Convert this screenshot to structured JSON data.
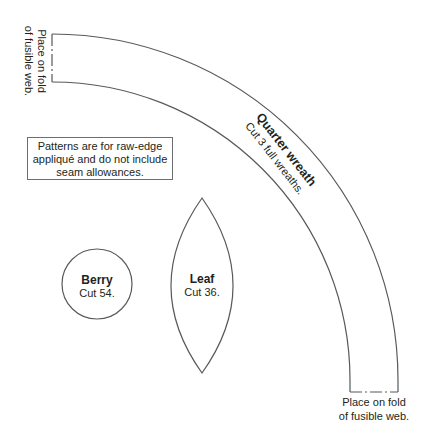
{
  "wreath": {
    "title": "Quarter wreath",
    "instruction": "Cut 3 full wreaths.",
    "fold_top": {
      "line1": "Place on fold",
      "line2": "of fusible web."
    },
    "fold_bottom": {
      "line1": "Place on fold",
      "line2": "of fusible web."
    }
  },
  "note": {
    "line1": "Patterns are for raw-edge",
    "line2": "appliqué and do not include",
    "line3": "seam allowances."
  },
  "berry": {
    "title": "Berry",
    "instruction": "Cut 54."
  },
  "leaf": {
    "title": "Leaf",
    "instruction": "Cut 36."
  },
  "colors": {
    "stroke": "#58595b",
    "text": "#231f20",
    "background": "#ffffff"
  }
}
